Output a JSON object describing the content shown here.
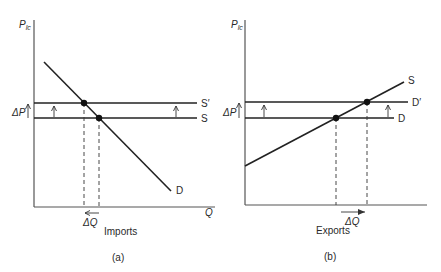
{
  "panels": [
    {
      "id": "a",
      "caption": "(a)",
      "y_axis_label_main": "P",
      "y_axis_label_sub": "lc",
      "x_axis_label": "Q",
      "delta_p_label": "ΔP",
      "delta_q_label": "ΔQ",
      "market_label": "Imports",
      "curves": {
        "upper_horizontal": "S′",
        "lower_horizontal": "S",
        "sloped": "D"
      },
      "delta_q_direction": "left"
    },
    {
      "id": "b",
      "caption": "(b)",
      "y_axis_label_main": "P",
      "y_axis_label_sub": "lc",
      "delta_p_label": "ΔP",
      "delta_q_label": "ΔQ",
      "market_label": "Exports",
      "curves": {
        "upper_horizontal": "D′",
        "lower_horizontal": "D",
        "sloped": "S"
      },
      "delta_q_direction": "right"
    }
  ],
  "colors": {
    "line": "#222222",
    "axis": "#555555",
    "text": "#2a2a2a"
  }
}
